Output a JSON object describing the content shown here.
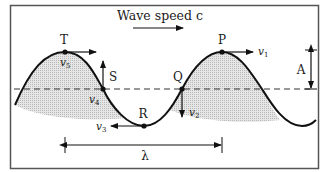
{
  "title": "Wave speed c",
  "points": {
    "T": {
      "label": "T",
      "velocity": "v",
      "sub": "5"
    },
    "S": {
      "label": "S",
      "velocity": "v",
      "sub": "4"
    },
    "R": {
      "label": "R",
      "velocity": "v",
      "sub": "3"
    },
    "Q": {
      "label": "Q",
      "velocity": "v",
      "sub": "2"
    },
    "P": {
      "label": "P",
      "velocity": "v",
      "sub": "1"
    }
  },
  "amplitude_label": "A",
  "wavelength_label": "λ",
  "colors": {
    "line": "#111111",
    "shade": "#cfcfcf",
    "frame": "#555555"
  }
}
